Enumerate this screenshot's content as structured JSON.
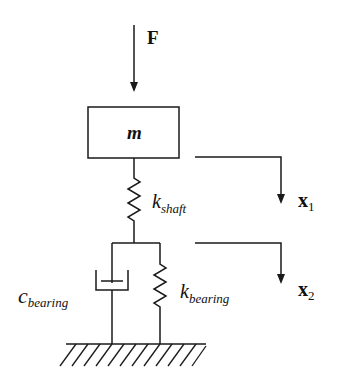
{
  "diagram": {
    "type": "two-degree-of-freedom mass-spring-damper system",
    "force_label": "F",
    "mass_label": "m",
    "shaft_spring": {
      "symbol": "k",
      "subscript": "shaft"
    },
    "bearing_damper": {
      "symbol": "c",
      "subscript": "bearing"
    },
    "bearing_spring": {
      "symbol": "k",
      "subscript": "bearing"
    },
    "displacement_1": {
      "symbol": "x",
      "subscript": "1"
    },
    "displacement_2": {
      "symbol": "x",
      "subscript": "2"
    },
    "colors": {
      "stroke": "#1a1a1a",
      "background": "#ffffff"
    }
  }
}
